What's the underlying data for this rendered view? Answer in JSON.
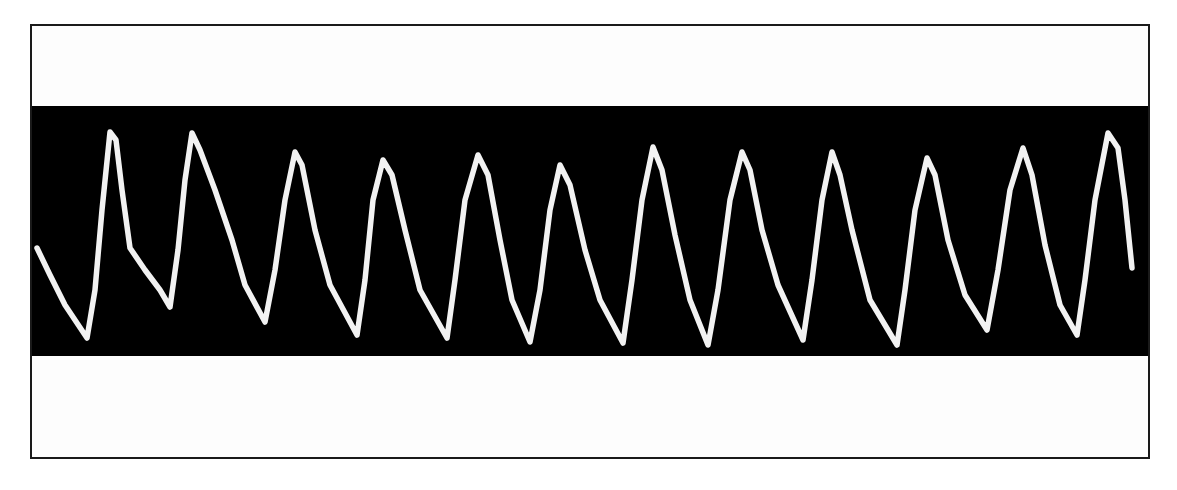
{
  "figure": {
    "background_color": "#ffffff",
    "frame_color": "#1a1a1a",
    "band_color": "#000000",
    "trace_color": "#f2f2f2",
    "frame": {
      "left": 30,
      "top": 24,
      "right": 1148,
      "bottom": 457
    },
    "band": {
      "top": 106,
      "bottom": 356
    }
  },
  "chart_data": {
    "type": "line",
    "title": "",
    "xlabel": "",
    "ylabel": "",
    "grid": false,
    "legend": null,
    "coordinate_space": "pixel coordinates of the screenshot (y increases downward)",
    "series": [
      {
        "name": "waveform",
        "points": [
          [
            37,
            248
          ],
          [
            50,
            275
          ],
          [
            65,
            305
          ],
          [
            87,
            338
          ],
          [
            95,
            290
          ],
          [
            102,
            210
          ],
          [
            110,
            132
          ],
          [
            116,
            140
          ],
          [
            122,
            190
          ],
          [
            130,
            248
          ],
          [
            145,
            270
          ],
          [
            160,
            290
          ],
          [
            170,
            307
          ],
          [
            178,
            250
          ],
          [
            185,
            180
          ],
          [
            192,
            133
          ],
          [
            200,
            150
          ],
          [
            215,
            190
          ],
          [
            232,
            240
          ],
          [
            245,
            285
          ],
          [
            265,
            322
          ],
          [
            275,
            270
          ],
          [
            285,
            200
          ],
          [
            295,
            152
          ],
          [
            302,
            165
          ],
          [
            315,
            230
          ],
          [
            330,
            285
          ],
          [
            357,
            335
          ],
          [
            365,
            280
          ],
          [
            373,
            200
          ],
          [
            383,
            160
          ],
          [
            392,
            175
          ],
          [
            405,
            230
          ],
          [
            420,
            290
          ],
          [
            447,
            338
          ],
          [
            455,
            280
          ],
          [
            465,
            200
          ],
          [
            478,
            155
          ],
          [
            488,
            175
          ],
          [
            500,
            240
          ],
          [
            512,
            300
          ],
          [
            530,
            342
          ],
          [
            540,
            290
          ],
          [
            550,
            210
          ],
          [
            560,
            165
          ],
          [
            570,
            185
          ],
          [
            585,
            250
          ],
          [
            600,
            300
          ],
          [
            623,
            343
          ],
          [
            632,
            280
          ],
          [
            642,
            200
          ],
          [
            653,
            147
          ],
          [
            662,
            170
          ],
          [
            675,
            235
          ],
          [
            690,
            300
          ],
          [
            708,
            345
          ],
          [
            718,
            290
          ],
          [
            730,
            200
          ],
          [
            742,
            152
          ],
          [
            750,
            170
          ],
          [
            762,
            230
          ],
          [
            778,
            285
          ],
          [
            803,
            340
          ],
          [
            812,
            280
          ],
          [
            822,
            200
          ],
          [
            832,
            152
          ],
          [
            840,
            175
          ],
          [
            852,
            230
          ],
          [
            870,
            300
          ],
          [
            897,
            345
          ],
          [
            905,
            290
          ],
          [
            915,
            210
          ],
          [
            927,
            158
          ],
          [
            935,
            175
          ],
          [
            948,
            240
          ],
          [
            965,
            295
          ],
          [
            987,
            330
          ],
          [
            998,
            270
          ],
          [
            1010,
            190
          ],
          [
            1023,
            148
          ],
          [
            1032,
            175
          ],
          [
            1045,
            245
          ],
          [
            1060,
            305
          ],
          [
            1077,
            335
          ],
          [
            1085,
            280
          ],
          [
            1095,
            200
          ],
          [
            1108,
            133
          ],
          [
            1118,
            148
          ],
          [
            1125,
            200
          ],
          [
            1132,
            268
          ]
        ]
      }
    ],
    "peaks": [
      {
        "x": 110,
        "y": 132
      },
      {
        "x": 192,
        "y": 133
      },
      {
        "x": 295,
        "y": 152
      },
      {
        "x": 383,
        "y": 160
      },
      {
        "x": 478,
        "y": 155
      },
      {
        "x": 560,
        "y": 165
      },
      {
        "x": 653,
        "y": 147
      },
      {
        "x": 742,
        "y": 152
      },
      {
        "x": 832,
        "y": 152
      },
      {
        "x": 927,
        "y": 158
      },
      {
        "x": 1023,
        "y": 148
      },
      {
        "x": 1108,
        "y": 133
      }
    ],
    "troughs": [
      {
        "x": 87,
        "y": 338
      },
      {
        "x": 170,
        "y": 307
      },
      {
        "x": 265,
        "y": 322
      },
      {
        "x": 357,
        "y": 335
      },
      {
        "x": 447,
        "y": 338
      },
      {
        "x": 530,
        "y": 342
      },
      {
        "x": 623,
        "y": 343
      },
      {
        "x": 708,
        "y": 345
      },
      {
        "x": 803,
        "y": 340
      },
      {
        "x": 897,
        "y": 345
      },
      {
        "x": 987,
        "y": 330
      },
      {
        "x": 1077,
        "y": 335
      }
    ],
    "peak_count": 12,
    "x_range": [
      37,
      1132
    ],
    "y_range": [
      132,
      345
    ]
  }
}
